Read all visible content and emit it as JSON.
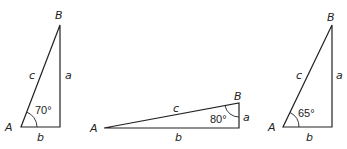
{
  "figure": {
    "triangles": [
      {
        "id": "triangle-1",
        "vertices": {
          "A": "A",
          "B": "B"
        },
        "sides": {
          "a": "a",
          "b": "b",
          "c": "c"
        },
        "angle_label": "70°",
        "angle_at": "A"
      },
      {
        "id": "triangle-2",
        "vertices": {
          "A": "A",
          "B": "B"
        },
        "sides": {
          "a": "a",
          "b": "b",
          "c": "c"
        },
        "angle_label": "80°",
        "angle_at": "B"
      },
      {
        "id": "triangle-3",
        "vertices": {
          "A": "A",
          "B": "B"
        },
        "sides": {
          "a": "a",
          "b": "b",
          "c": "c"
        },
        "angle_label": "65°",
        "angle_at": "A"
      }
    ],
    "colors": {
      "stroke": "#222222",
      "background": "#ffffff"
    }
  }
}
